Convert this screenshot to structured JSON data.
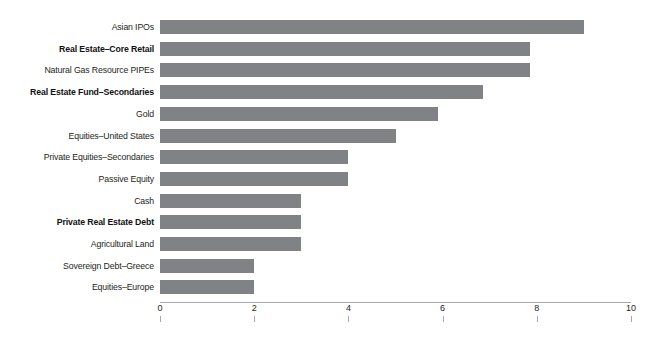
{
  "chart_data": {
    "type": "bar",
    "orientation": "horizontal",
    "title": "",
    "subtitle": "",
    "xlabel": "",
    "ylabel": "",
    "xlim": [
      0,
      10
    ],
    "xticks": [
      "0",
      "2",
      "4",
      "6",
      "8",
      "10"
    ],
    "xtick_values": [
      0,
      2,
      4,
      6,
      8,
      10
    ],
    "grid": false,
    "legend": "none",
    "bar_color": "#808285",
    "axis_color": "#a7a9ac",
    "label_color": "#231f20",
    "categories": [
      "Asian IPOs",
      "Real Estate–Core Retail",
      "Natural Gas Resource PIPEs",
      "Real Estate Fund–Secondaries",
      "Gold",
      "Equities–United States",
      "Private Equities–Secondaries",
      "Passive Equity",
      "Cash",
      "Private Real Estate Debt",
      "Agricultural Land",
      "Sovereign Debt–Greece",
      "Equities–Europe"
    ],
    "values": [
      9.0,
      7.85,
      7.85,
      6.85,
      5.9,
      5.0,
      4.0,
      4.0,
      3.0,
      3.0,
      3.0,
      2.0,
      2.0
    ],
    "emphasis": [
      false,
      true,
      false,
      true,
      false,
      false,
      false,
      false,
      false,
      true,
      false,
      false,
      false
    ],
    "bars": [
      {
        "label": "Asian IPOs",
        "value": 9.0,
        "bold": false
      },
      {
        "label": "Real Estate–Core Retail",
        "value": 7.85,
        "bold": true
      },
      {
        "label": "Natural Gas Resource PIPEs",
        "value": 7.85,
        "bold": false
      },
      {
        "label": "Real Estate Fund–Secondaries",
        "value": 6.85,
        "bold": true
      },
      {
        "label": "Gold",
        "value": 5.9,
        "bold": false
      },
      {
        "label": "Equities–United States",
        "value": 5.0,
        "bold": false
      },
      {
        "label": "Private Equities–Secondaries",
        "value": 4.0,
        "bold": false
      },
      {
        "label": "Passive Equity",
        "value": 4.0,
        "bold": false
      },
      {
        "label": "Cash",
        "value": 3.0,
        "bold": false
      },
      {
        "label": "Private Real Estate Debt",
        "value": 3.0,
        "bold": true
      },
      {
        "label": "Agricultural Land",
        "value": 3.0,
        "bold": false
      },
      {
        "label": "Sovereign Debt–Greece",
        "value": 2.0,
        "bold": false
      },
      {
        "label": "Equities–Europe",
        "value": 2.0,
        "bold": false
      }
    ]
  }
}
